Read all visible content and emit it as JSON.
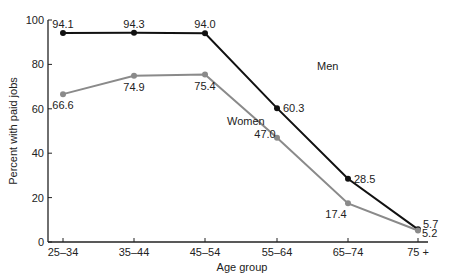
{
  "chart_data": {
    "type": "line",
    "title": "",
    "xlabel": "Age group",
    "ylabel": "Percent with paid jobs",
    "categories": [
      "25–34",
      "35–44",
      "45–54",
      "55–64",
      "65–74",
      "75 +"
    ],
    "ylim": [
      0,
      100
    ],
    "yticks": [
      0,
      20,
      40,
      60,
      80,
      100
    ],
    "grid": false,
    "series": [
      {
        "name": "Men",
        "color": "#111111",
        "values": [
          94.1,
          94.3,
          94.0,
          60.3,
          28.5,
          5.7
        ],
        "labels": [
          "94.1",
          "94.3",
          "94.0",
          "60.3",
          "28.5",
          "5.7"
        ]
      },
      {
        "name": "Women",
        "color": "#8a8a8a",
        "values": [
          66.6,
          74.9,
          75.4,
          47.0,
          17.4,
          5.2
        ],
        "labels": [
          "66.6",
          "74.9",
          "75.4",
          "47.0",
          "17.4",
          "5.2"
        ]
      }
    ]
  }
}
